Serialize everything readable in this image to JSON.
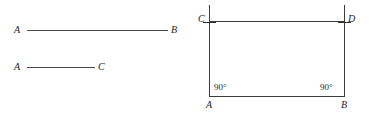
{
  "figure": {
    "width": 375,
    "height": 118,
    "background": "#ffffff",
    "stroke_color": "#3c3c3c",
    "text_color": "#1c1c1c"
  },
  "left_panel": {
    "name": "two-line-segments",
    "segments": [
      {
        "id": "segment-ab",
        "start_label": "A",
        "end_label": "B",
        "x1": 27,
        "x2": 168,
        "y": 30,
        "length_px": 141
      },
      {
        "id": "segment-ac",
        "start_label": "A",
        "end_label": "C",
        "x1": 27,
        "x2": 95,
        "y": 67,
        "length_px": 68
      }
    ]
  },
  "right_panel": {
    "name": "rectangle-construction",
    "rectangle": {
      "vertices": {
        "bottom_left": "A",
        "bottom_right": "B",
        "top_left": "C",
        "top_right": "D"
      },
      "left_x": 209,
      "right_x": 344,
      "top_y": 21,
      "bottom_y": 96
    },
    "vertical_overhang": {
      "top_y": 5,
      "description": "perpendicular construction lines extend above C and D"
    },
    "tick_marks": [
      {
        "id": "tick-at-c",
        "x": 209,
        "y": 21
      },
      {
        "id": "tick-at-d",
        "x": 344,
        "y": 21
      }
    ],
    "angle_labels": [
      {
        "id": "angle-at-a",
        "value": "90°",
        "x": 214,
        "y": 83
      },
      {
        "id": "angle-at-b",
        "value": "90°",
        "x": 320,
        "y": 83
      }
    ],
    "vertex_labels": [
      {
        "id": "label-c",
        "text": "C",
        "x": 198,
        "y": 15
      },
      {
        "id": "label-d",
        "text": "D",
        "x": 348,
        "y": 15
      },
      {
        "id": "label-a",
        "text": "A",
        "x": 206,
        "y": 101
      },
      {
        "id": "label-b",
        "text": "B",
        "x": 341,
        "y": 101
      }
    ]
  }
}
